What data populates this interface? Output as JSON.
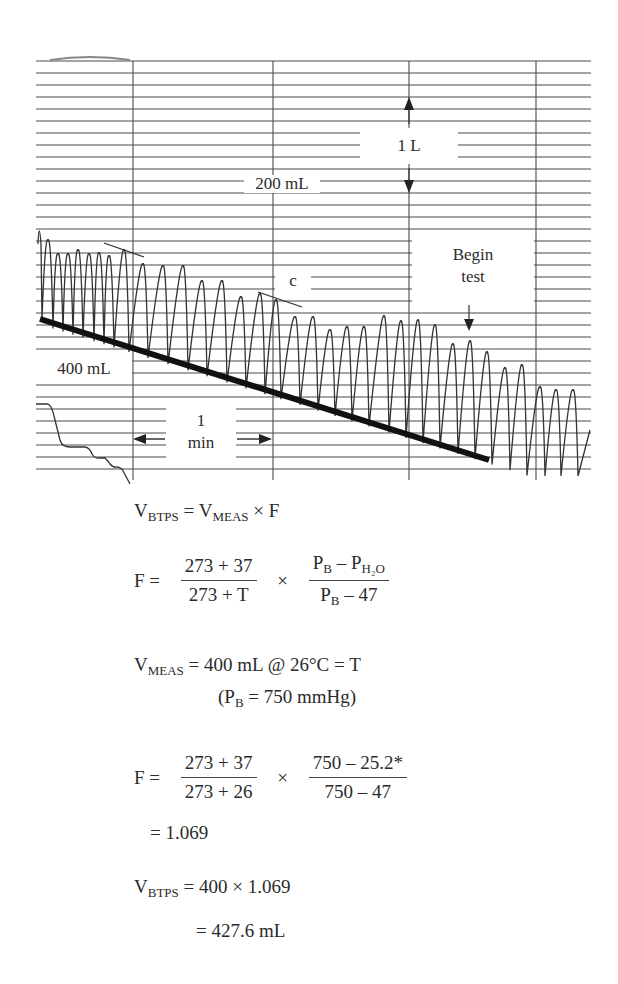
{
  "diagram": {
    "labels": {
      "scale_volume": "1 L",
      "scale_small": "200 mL",
      "begin_test_line1": "Begin",
      "begin_test_line2": "test",
      "point_c": "c",
      "volume_400": "400 mL",
      "time_line1": "1",
      "time_line2": "min"
    },
    "colors": {
      "ink": "#2b2b2b",
      "grid": "#4a4a4a",
      "paper": "#ffffff"
    }
  },
  "equations": {
    "eq1": {
      "lhs": "V",
      "lhs_sub": "BTPS",
      "eq": "=",
      "rhs": "V",
      "rhs_sub": "MEAS",
      "tail": "× F"
    },
    "eq2": {
      "lhs": "F =",
      "frac1_num": "273 + 37",
      "frac1_den": "273 + T",
      "times": "×",
      "frac2_num_a": "P",
      "frac2_num_a_sub": "B",
      "frac2_num_minus": " – P",
      "frac2_num_b_sub": "H₂O",
      "frac2_den_a": "P",
      "frac2_den_a_sub": "B",
      "frac2_den_tail": " – 47"
    },
    "eq3": {
      "lhs": "V",
      "lhs_sub": "MEAS",
      "rhs": " = 400 mL @ 26°C = T"
    },
    "eq3b": {
      "open": "(P",
      "sub": "B",
      "rest": " = 750 mmHg)"
    },
    "eq4": {
      "lhs": "F =",
      "frac1_num": "273 + 37",
      "frac1_den": "273 + 26",
      "times": "×",
      "frac2_num": "750 – 25.2*",
      "frac2_den": "750 – 47"
    },
    "eq5": {
      "text": "= 1.069"
    },
    "eq6": {
      "lhs": "V",
      "lhs_sub": "BTPS",
      "rhs": " = 400 × 1.069"
    },
    "eq7": {
      "text": "= 427.6 mL"
    }
  }
}
